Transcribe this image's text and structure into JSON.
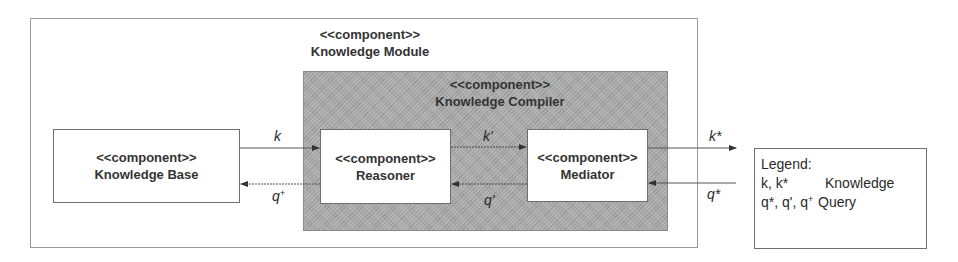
{
  "diagram": {
    "type": "uml-component-diagram",
    "outer_component": {
      "stereotype": "<<component>>",
      "name": "Knowledge Module"
    },
    "inner_component": {
      "stereotype": "<<component>>",
      "name": "Knowledge Compiler",
      "fill_color": "#a8a8a8"
    },
    "components": [
      {
        "id": "kb",
        "stereotype": "<<component>>",
        "name": "Knowledge Base"
      },
      {
        "id": "reasoner",
        "stereotype": "<<component>>",
        "name": "Reasoner"
      },
      {
        "id": "mediator",
        "stereotype": "<<component>>",
        "name": "Mediator"
      }
    ],
    "arrows": [
      {
        "from": "Knowledge Base",
        "to": "Reasoner",
        "label": "k",
        "style": "solid"
      },
      {
        "from": "Reasoner",
        "to": "Knowledge Base",
        "label": "q",
        "sup": "+",
        "style": "dotted"
      },
      {
        "from": "Reasoner",
        "to": "Mediator",
        "label": "k'",
        "style": "dotted"
      },
      {
        "from": "Mediator",
        "to": "Reasoner",
        "label": "q'",
        "style": "dotted"
      },
      {
        "from": "Mediator",
        "to": "external",
        "label": "k*",
        "style": "solid"
      },
      {
        "from": "external",
        "to": "Mediator",
        "label": "q*",
        "style": "solid"
      }
    ],
    "legend": {
      "title": "Legend:",
      "rows": [
        {
          "key": "k, k*",
          "value": "Knowledge"
        },
        {
          "key_parts": [
            "q*, q', q",
            "+"
          ],
          "value": "Query"
        }
      ]
    }
  }
}
